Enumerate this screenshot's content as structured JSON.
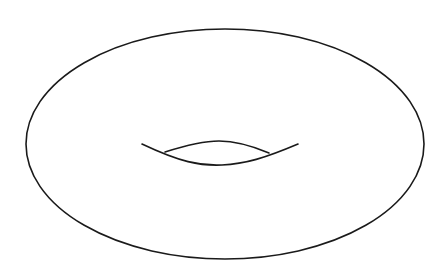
{
  "diagram": {
    "stroke_color": "#1a1a1a",
    "background_color": "#ffffff",
    "parts": [
      {
        "name": "outer-contour",
        "kind": "ellipse"
      },
      {
        "name": "hole-lower-contour",
        "kind": "curve"
      },
      {
        "name": "hole-upper-contour",
        "kind": "curve"
      }
    ]
  }
}
